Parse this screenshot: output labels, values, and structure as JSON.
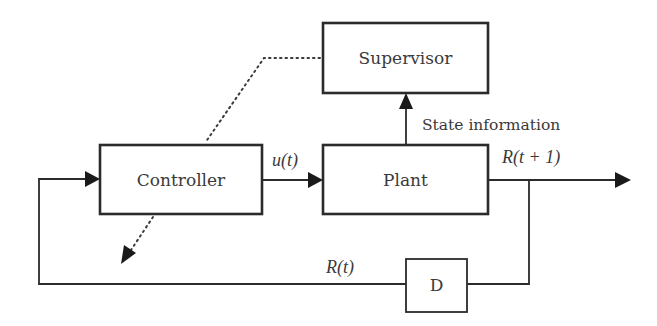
{
  "diagram": {
    "type": "block-diagram",
    "blocks": {
      "supervisor": {
        "label": "Supervisor"
      },
      "controller": {
        "label": "Controller"
      },
      "plant": {
        "label": "Plant"
      },
      "delay": {
        "label": "D"
      }
    },
    "signals": {
      "control_input": {
        "label": "u(t)"
      },
      "output": {
        "label": "R(t + 1)"
      },
      "feedback": {
        "label": "R(t)"
      },
      "state_info": {
        "label": "State information"
      }
    },
    "colors": {
      "line": "#2b2b2b",
      "text": "#3a3a3a",
      "background": "#ffffff"
    }
  }
}
